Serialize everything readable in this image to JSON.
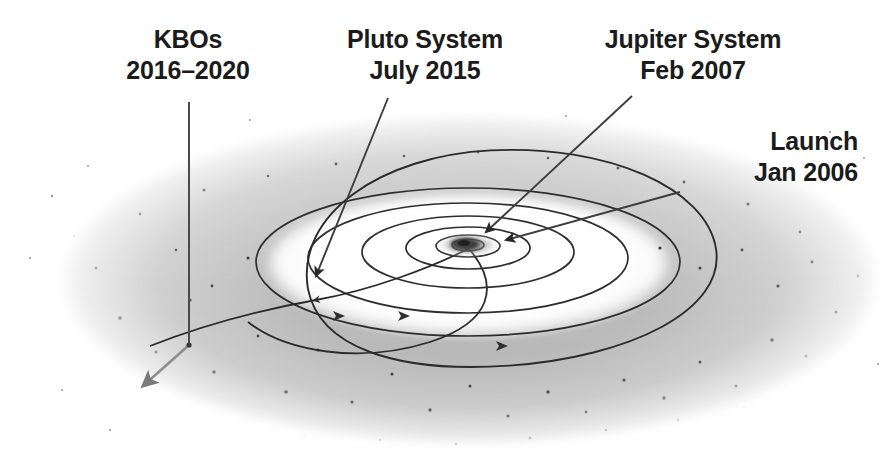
{
  "figure": {
    "background_color": "#ffffff",
    "ink_color": "#1b1b1b",
    "belt_color": "#808080"
  },
  "annotations": [
    {
      "id": "kbos",
      "name": "kbos",
      "line1": "KBOs",
      "line2": "2016–2020",
      "leader": "vertical-then-diagonal-arrow-to-lower-left",
      "target": "kuiper-belt-objects"
    },
    {
      "id": "pluto",
      "name": "pluto-system",
      "line1": "Pluto System",
      "line2": "July 2015",
      "leader": "diagonal-arrow-down-left",
      "target": "pluto-encounter-point"
    },
    {
      "id": "jupiter",
      "name": "jupiter-system",
      "line1": "Jupiter System",
      "line2": "Feb 2007",
      "leader": "diagonal-arrow-down-left",
      "target": "jupiter-gravity-assist-point"
    },
    {
      "id": "launch",
      "name": "launch",
      "line1": "Launch",
      "line2": "Jan 2006",
      "leader": "short-diagonal-line-left",
      "target": "earth-launch-point"
    }
  ],
  "scene": {
    "kuiper_belt": "stippled-torus-band",
    "orbits": [
      "inner-planet-orbit",
      "mid-planet-orbit",
      "outer-planet-orbit",
      "pluto-inclined-orbit"
    ],
    "sun": "central-bright-disc",
    "trajectory": "new-horizons-escape-path"
  }
}
